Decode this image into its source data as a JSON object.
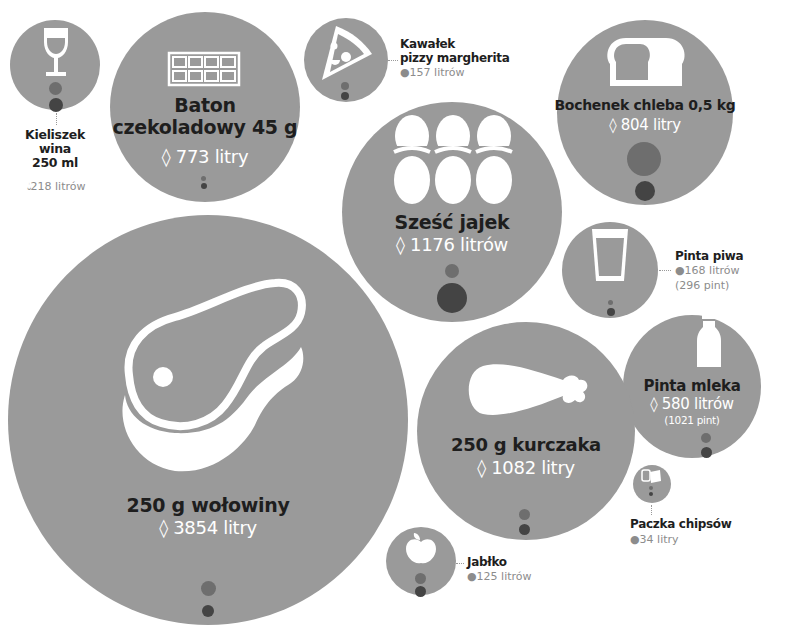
{
  "colors": {
    "bubble": "#9a9a9a",
    "title": "#1e1e1e",
    "value_inside": "#ffffff",
    "value_outside": "#8c8c8c",
    "dot_light": "#6e6e6e",
    "dot_dark": "#444444"
  },
  "items": {
    "wine": {
      "title_l1": "Kieliszek",
      "title_l2": "wina",
      "title_l3": "250 ml",
      "value": "218 litrów",
      "icon": "wine-glass-icon"
    },
    "chocolate": {
      "title_l1": "Baton",
      "title_l2": "czekoladowy 45 g",
      "value": "773 litry",
      "icon": "chocolate-bar-icon"
    },
    "pizza": {
      "title_l1": "Kawałek",
      "title_l2": "pizzy margherita",
      "value": "157 litrów",
      "icon": "pizza-slice-icon"
    },
    "bread": {
      "title": "Bochenek chleba 0,5 kg",
      "value": "804 litry",
      "icon": "bread-icon"
    },
    "eggs": {
      "title": "Sześć jajek",
      "value": "1176 litrów",
      "icon": "eggs-icon"
    },
    "beer": {
      "title": "Pinta piwa",
      "value": "168 litrów",
      "sub": "(296 pint)",
      "icon": "beer-glass-icon"
    },
    "milk": {
      "title": "Pinta mleka",
      "value": "580 litrów",
      "sub": "(1021 pint)",
      "icon": "milk-bottle-icon"
    },
    "chicken": {
      "title": "250 g kurczaka",
      "value": "1082 litry",
      "icon": "chicken-leg-icon"
    },
    "beef": {
      "title": "250 g wołowiny",
      "value": "3854 litry",
      "icon": "steak-icon"
    },
    "chips": {
      "title": "Paczka chipsów",
      "value": "34 litry",
      "icon": "chips-bag-icon"
    },
    "apple": {
      "title": "Jabłko",
      "value": "125 litrów",
      "icon": "apple-icon"
    }
  },
  "drop_glyph": "water-drop-icon"
}
